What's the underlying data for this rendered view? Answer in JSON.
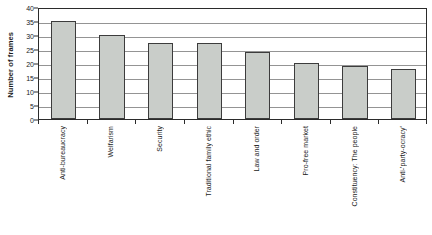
{
  "chart_data": {
    "type": "bar",
    "title": "",
    "xlabel": "",
    "ylabel": "Number of frames",
    "ylim": [
      0,
      40
    ],
    "ytick_step": 5,
    "yticks": [
      0,
      5,
      10,
      15,
      20,
      25,
      30,
      35,
      40
    ],
    "grid": true,
    "legend": "none",
    "categories": [
      "Anti-bureaucracy",
      "Welfarism",
      "Security",
      "Traditional family ethic",
      "Law and order",
      "Pro-free market",
      "Constituency: The people",
      "Anti-'party-ocracy'"
    ],
    "values": [
      35,
      30,
      27,
      27,
      24,
      20,
      19,
      18
    ],
    "series": [
      {
        "name": "Number of frames",
        "values": [
          35,
          30,
          27,
          27,
          24,
          20,
          19,
          18
        ]
      }
    ],
    "colors": {
      "bar_fill": "#c9cdc9",
      "bar_border": "#3c3c3c",
      "gridline": "#949494",
      "axis": "#2b2b2b",
      "text": "#1a1a1a",
      "background": "#ffffff"
    }
  }
}
